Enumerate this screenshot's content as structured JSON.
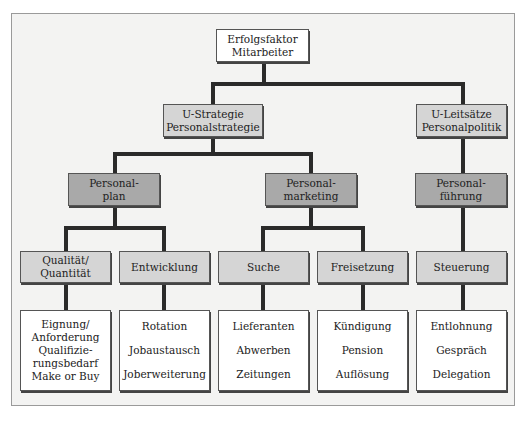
{
  "diagram": {
    "root": {
      "label_1": "Erfolgsfaktor",
      "label_2": "Mitarbeiter"
    },
    "level1": [
      {
        "label_1": "U-Strategie",
        "label_2": "Personalstrategie"
      },
      {
        "label_1": "U-Leitsätze",
        "label_2": "Personalpolitik"
      }
    ],
    "level2": [
      {
        "label_1": "Personal-",
        "label_2": "plan"
      },
      {
        "label_1": "Personal-",
        "label_2": "marketing"
      },
      {
        "label_1": "Personal-",
        "label_2": "führung"
      }
    ],
    "level3": [
      {
        "label_1": "Qualität/",
        "label_2": "Quantität"
      },
      {
        "label_1": "Entwicklung"
      },
      {
        "label_1": "Suche"
      },
      {
        "label_1": "Freisetzung"
      },
      {
        "label_1": "Steuerung"
      }
    ],
    "level4": [
      {
        "items": [
          "Eignung/",
          "Anforderung",
          "Qualifizie-",
          "rungsbedarf",
          "Make or Buy"
        ]
      },
      {
        "items": [
          "Rotation",
          "Jobaustausch",
          "Joberweiterung"
        ]
      },
      {
        "items": [
          "Lieferanten",
          "Abwerben",
          "Zeitungen"
        ]
      },
      {
        "items": [
          "Kündigung",
          "Pension",
          "Auflösung"
        ]
      },
      {
        "items": [
          "Entlohnung",
          "Gespräch",
          "Delegation"
        ]
      }
    ],
    "colors": {
      "dark_fill": "#a9a9a9",
      "light_fill": "#d5d5d5",
      "white_fill": "#ffffff",
      "line": "#2a2a2a",
      "frame_bg": "#f3f3f2"
    }
  }
}
